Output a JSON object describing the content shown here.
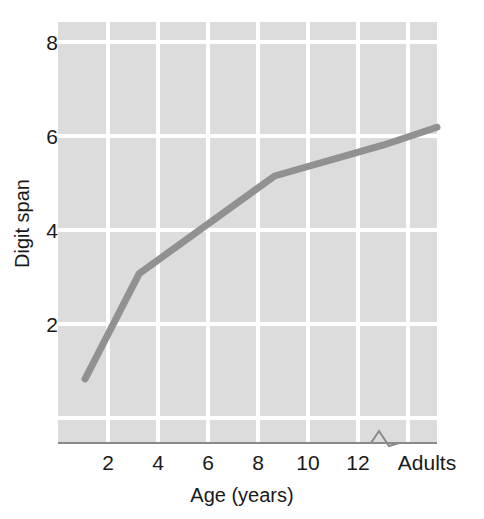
{
  "chart_data": {
    "type": "line",
    "title": "",
    "xlabel": "Age (years)",
    "ylabel": "Digit span",
    "x_tick_labels": [
      "2",
      "4",
      "6",
      "8",
      "10",
      "12",
      "Adults"
    ],
    "y_tick_labels": [
      "2",
      "4",
      "6",
      "8"
    ],
    "y_ticks": [
      2,
      4,
      6,
      8
    ],
    "ylim": [
      0.6,
      8.8
    ],
    "xlim": [
      1,
      15
    ],
    "grid": true,
    "legend": false,
    "axis_break": true,
    "axis_break_note": "zigzag break on x-axis between 12 and Adults",
    "series": [
      {
        "name": "Digit span by age",
        "x": [
          2,
          4,
          9,
          13,
          15
        ],
        "x_labels": [
          "2",
          "4",
          "9",
          "12.5",
          "Adults"
        ],
        "values": [
          1.85,
          3.9,
          5.8,
          6.4,
          6.75
        ]
      }
    ],
    "colors": {
      "line": "#919191",
      "plot_background": "#dcdcdc",
      "gridline": "#ffffff",
      "axis": "#8a8a8a",
      "text": "#1a1a1a"
    }
  },
  "axes": {
    "y_label": "Digit span",
    "x_label": "Age (years)",
    "y_ticks": [
      {
        "label": "8"
      },
      {
        "label": "6"
      },
      {
        "label": "4"
      },
      {
        "label": "2"
      }
    ],
    "x_ticks": [
      {
        "label": "2"
      },
      {
        "label": "4"
      },
      {
        "label": "6"
      },
      {
        "label": "8"
      },
      {
        "label": "10"
      },
      {
        "label": "12"
      },
      {
        "label": "Adults"
      }
    ]
  }
}
